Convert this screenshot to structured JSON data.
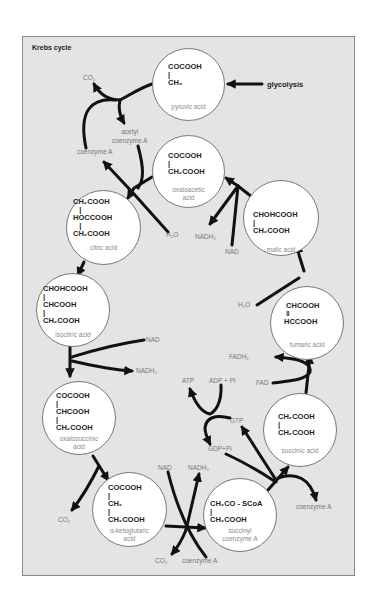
{
  "title": "Krebs cycle",
  "input": "glycolysis",
  "colors": {
    "background": "#e4e4e4",
    "circle_fill": "#ffffff",
    "arrow": "#111111",
    "formula_text": "#222222",
    "name_text": "#8a8a8a"
  },
  "molecules": [
    {
      "id": "pyruvic",
      "formula": [
        "COCOOH",
        "|",
        "CH3"
      ],
      "name": "pyruvic acid"
    },
    {
      "id": "oxaloacetic",
      "formula": [
        "COCOOH",
        "|",
        "CH2COOH"
      ],
      "name": "oxaloacetic acid"
    },
    {
      "id": "citric",
      "formula": [
        "CH2COOH",
        "|",
        "HOCCOOH",
        "|",
        "CH2COOH"
      ],
      "name": "citric acid"
    },
    {
      "id": "malic",
      "formula": [
        "CHOHCOOH",
        "|",
        "CH2COOH"
      ],
      "name": "malic acid"
    },
    {
      "id": "isocitric",
      "formula": [
        "CHOHCOOH",
        "|",
        "CHCOOH",
        "|",
        "CH2COOH"
      ],
      "name": "isocitric acid"
    },
    {
      "id": "fumaric",
      "formula": [
        "CHCOOH",
        "||",
        "HCCOOH"
      ],
      "name": "fumaric acid"
    },
    {
      "id": "oxalosuccinic",
      "formula": [
        "COCOOH",
        "|",
        "CHCOOH",
        "|",
        "CH2COOH"
      ],
      "name": "oxalosuccinic acid"
    },
    {
      "id": "succinic",
      "formula": [
        "CH2COOH",
        "|",
        "CH2COOH"
      ],
      "name": "succinic acid"
    },
    {
      "id": "ketoglutaric",
      "formula": [
        "COCOOH",
        "|",
        "CH2",
        "|",
        "CH2COOH"
      ],
      "name": "α-ketoglutaric acid"
    },
    {
      "id": "succinyl",
      "formula": [
        "CH2CO - SCoA",
        "|",
        "CH2COOH"
      ],
      "name": "succinyl coenzyme A"
    }
  ],
  "text": {
    "pyruvic_f": "COCOOH\n|\nCH₃",
    "pyruvic_n": "pyruvic acid",
    "oxalo_f": "COCOOH\n|\nCH₂COOH",
    "oxalo_n": "oxaloacetic\nacid",
    "citric_f": "CH₂COOH\n   |\nHOCCOOH\n   |\nCH₂COOH",
    "citric_n": "citric acid",
    "malic_f": "CHOHCOOH\n|\nCH₂COOH",
    "malic_n": "malic acid",
    "isocitric_f": "CHOHCOOH\n|\nCHCOOH\n|\nCH₂COOH",
    "isocitric_n": "isocitric acid",
    "fumaric_f": " CHCOOH\n ‖\nHCCOOH",
    "fumaric_n": "fumaric acid",
    "oxalosucc_f": "COCOOH\n|\nCHCOOH\n|\nCH₂COOH",
    "oxalosucc_n": "oxalosuccinic\nacid",
    "succinic_f": "CH₂COOH\n|\nCH₂COOH",
    "succinic_n": "succinic acid",
    "keto_f": "COCOOH\n|\nCH₂\n|\nCH₂COOH",
    "keto_n": "α-ketoglutaric\nacid",
    "succinyl_f": "CH₂CO - SCoA\n|\nCH₂COOH",
    "succinyl_n": "succinyl\ncoenzyme A"
  },
  "labels": {
    "co2_top": "CO₂",
    "acetyl_coa": "acetyl\ncoenzyme A",
    "coa_left": "coenzyme A",
    "h2o_citric": "H₂O",
    "nadh2_oxalo": "NADH₂",
    "nad_oxalo": "NAD",
    "h2o_fumaric": "H₂O",
    "nad_isocitric": "NAD",
    "nadh2_isocitric": "NADH₂",
    "fadh2": "FADH₂",
    "fad": "FAD",
    "atp": "ATP",
    "adp_pi": "ADP + Pi",
    "gtp": "GTP",
    "gdp_pi": "GDP+Pi",
    "co2_oxalosucc": "CO₂",
    "nad_keto": "NAD",
    "nadh2_keto": "NADH₂",
    "co2_bottom": "CO₂",
    "coa_bottom": "coenzyme A",
    "coa_right": "coenzyme A"
  }
}
